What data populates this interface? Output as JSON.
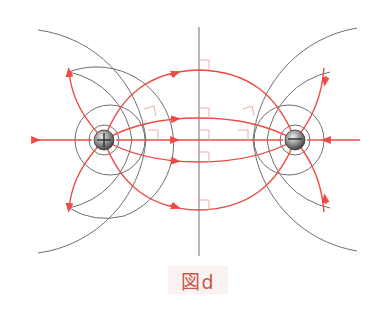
{
  "figure": {
    "caption": "図d",
    "colors": {
      "field_line": "#ee4a44",
      "equipotential": "#6f6f6f",
      "right_angle_marker": "#e9a4a0",
      "caption_text": "#c8564e",
      "caption_bg": "#fbf3f1"
    },
    "charges": [
      {
        "sign": "+",
        "label": "positive-charge",
        "cx": 104,
        "cy": 140
      },
      {
        "sign": "-",
        "label": "negative-charge",
        "cx": 295,
        "cy": 140
      }
    ]
  }
}
